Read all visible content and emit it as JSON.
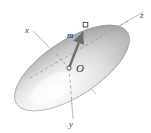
{
  "figure": {
    "type": "3d-geometry-diagram",
    "background_color": "#ffffff"
  },
  "labels": {
    "axis_x": "x",
    "axis_y": "y",
    "axis_z": "z",
    "origin": "O",
    "vector": "m"
  },
  "colors": {
    "surface_light": "#fbfbfb",
    "surface_mid": "#d8d8d8",
    "surface_dark": "#9e9e9e",
    "outline": "#8c8c8c",
    "axis_line": "#a8a8a8",
    "dashed_line": "#9a9a9a",
    "vector_fill": "#6e6e6e",
    "text": "#4a4a4a",
    "marker_fill": "#ffffff",
    "marker_stroke": "#3a3a3a"
  },
  "geometry": {
    "ellipsoid": {
      "center_x": 72,
      "center_y": 68,
      "semi_major": 66,
      "semi_minor": 28,
      "rotation_deg": -33
    },
    "origin_point": {
      "x": 69,
      "y": 68
    },
    "vector_tip": {
      "x": 86,
      "y": 26
    },
    "axis_x_start": {
      "x": 33,
      "y": 31
    },
    "axis_x_end": {
      "x": 96,
      "y": 94
    },
    "axis_y_start": {
      "x": 69,
      "y": 68
    },
    "axis_y_end": {
      "x": 73,
      "y": 119
    },
    "axis_z_start": {
      "x": 25,
      "y": 81
    },
    "axis_z_end": {
      "x": 143,
      "y": 12
    }
  }
}
